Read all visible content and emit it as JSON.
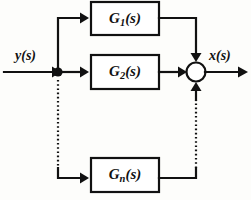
{
  "diagram": {
    "type": "control-system-block-diagram",
    "background_color": "#fdfdfb",
    "line_color": "#111111",
    "input": {
      "label": "y(s)",
      "name": "input-signal-label"
    },
    "output": {
      "label": "x(s)",
      "name": "output-signal-label"
    },
    "blocks": [
      {
        "id": "g1",
        "label_main": "G",
        "label_sub": "1",
        "label_tail": "(s)",
        "full_label": "G1(s)"
      },
      {
        "id": "g2",
        "label_main": "G",
        "label_sub": "2",
        "label_tail": "(s)",
        "full_label": "G2(s)"
      },
      {
        "id": "gn",
        "label_main": "G",
        "label_sub": "n",
        "label_tail": "(s)",
        "full_label": "Gn(s)"
      }
    ],
    "summing_junction": {
      "name": "summing-junction",
      "shape": "circle",
      "fill": "#ffffff"
    },
    "branch_node": {
      "name": "branch-node",
      "shape": "filled-dot",
      "fill": "#111111"
    },
    "ellipsis_note": "dotted vertical lines indicate omitted intermediate parallel paths"
  }
}
